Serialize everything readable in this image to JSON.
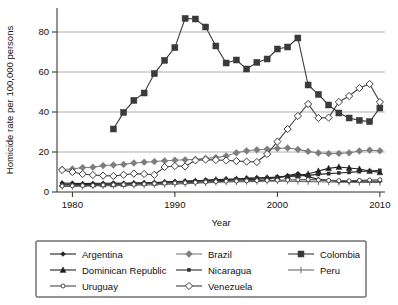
{
  "chart_data": {
    "type": "line",
    "title": "",
    "xlabel": "Year",
    "ylabel": "Homicide rate per 100,000 persons",
    "xlim": [
      1978.5,
      2010.5
    ],
    "ylim": [
      0,
      92
    ],
    "xticks": [
      1980,
      1990,
      2000,
      2010
    ],
    "yticks": [
      0,
      20,
      40,
      60,
      80
    ],
    "xtick_labels": [
      "1980",
      "1990",
      "2000",
      "2010"
    ],
    "ytick_labels": [
      "0",
      "20",
      "40",
      "60",
      "80"
    ],
    "grid": "horizontal",
    "legend_position": "below-plot",
    "series": [
      {
        "name": "Argentina",
        "marker": "filled-diamond-small",
        "color": "#1f1f1f",
        "x": [
          1979,
          1980,
          1981,
          1982,
          1983,
          1984,
          1985,
          1986,
          1987,
          1988,
          1989,
          1990,
          1991,
          1992,
          1993,
          1994,
          1995,
          1996,
          1997,
          1998,
          1999,
          2000,
          2001,
          2002,
          2003,
          2004,
          2005,
          2006,
          2007,
          2008,
          2009,
          2010
        ],
        "y": [
          4.5,
          4.4,
          4.2,
          4.3,
          4.4,
          4.5,
          4.4,
          4.6,
          4.6,
          4.7,
          5.0,
          5.2,
          5.3,
          5.4,
          5.5,
          5.6,
          5.8,
          6.0,
          6.2,
          6.4,
          6.6,
          7.2,
          8.2,
          9.2,
          7.6,
          6.3,
          5.8,
          5.3,
          5.2,
          5.3,
          5.5,
          5.4
        ]
      },
      {
        "name": "Brazil",
        "marker": "filled-diamond",
        "color": "#7d7d7d",
        "x": [
          1979,
          1980,
          1981,
          1982,
          1983,
          1984,
          1985,
          1986,
          1987,
          1988,
          1989,
          1990,
          1991,
          1992,
          1993,
          1994,
          1995,
          1996,
          1997,
          1998,
          1999,
          2000,
          2001,
          2002,
          2003,
          2004,
          2005,
          2006,
          2007,
          2008,
          2009,
          2010
        ],
        "y": [
          11.3,
          11.5,
          12.2,
          12.4,
          13.2,
          13.5,
          13.8,
          14.5,
          14.9,
          15.2,
          15.6,
          15.9,
          16.1,
          16.3,
          16.8,
          17.2,
          18.0,
          19.6,
          20.6,
          21.1,
          21.4,
          21.8,
          22.0,
          21.3,
          20.3,
          19.5,
          19.2,
          19.3,
          19.6,
          20.5,
          20.9,
          20.6
        ]
      },
      {
        "name": "Colombia",
        "marker": "filled-square",
        "color": "#3a3a3a",
        "x": [
          1984,
          1985,
          1986,
          1987,
          1988,
          1989,
          1990,
          1991,
          1992,
          1993,
          1994,
          1995,
          1996,
          1997,
          1998,
          1999,
          2000,
          2001,
          2002,
          2003,
          2004,
          2005,
          2006,
          2007,
          2008,
          2009,
          2010
        ],
        "y": [
          31.5,
          39.8,
          45.8,
          49.5,
          59.2,
          65.8,
          72.2,
          86.8,
          86.5,
          82.5,
          73.0,
          64.5,
          66.0,
          61.5,
          64.8,
          66.5,
          71.5,
          72.5,
          77.0,
          53.5,
          48.8,
          43.5,
          39.5,
          37.0,
          35.8,
          35.2,
          42.0
        ]
      },
      {
        "name": "Dominican Republic",
        "marker": "filled-triangle",
        "color": "#1f1f1f",
        "x": [
          1979,
          1980,
          1981,
          1982,
          1983,
          1984,
          1985,
          1986,
          1987,
          1988,
          1989,
          1990,
          1991,
          1992,
          1993,
          1994,
          1995,
          1996,
          1997,
          1998,
          1999,
          2000,
          2001,
          2002,
          2003,
          2004,
          2005,
          2006,
          2007,
          2008,
          2009,
          2010
        ],
        "y": [
          4.0,
          3.9,
          3.8,
          3.7,
          3.7,
          3.8,
          4.0,
          4.2,
          4.4,
          4.6,
          4.8,
          5.0,
          5.3,
          5.5,
          5.8,
          6.2,
          6.4,
          6.5,
          6.8,
          7.0,
          7.2,
          7.4,
          7.8,
          8.3,
          9.0,
          10.5,
          11.8,
          12.5,
          12.0,
          11.5,
          10.5,
          9.8
        ]
      },
      {
        "name": "Nicaragua",
        "marker": "small-square",
        "color": "#2b2b2b",
        "x": [
          1979,
          1980,
          1981,
          1982,
          1983,
          1984,
          1985,
          1986,
          1987,
          1988,
          1989,
          1990,
          1991,
          1992,
          1993,
          1994,
          1995,
          1996,
          1997,
          1998,
          1999,
          2000,
          2001,
          2002,
          2003,
          2004,
          2005,
          2006,
          2007,
          2008,
          2009,
          2010
        ],
        "y": [
          3.6,
          3.5,
          3.5,
          3.6,
          3.8,
          3.9,
          4.0,
          4.1,
          4.3,
          4.5,
          4.8,
          5.0,
          5.3,
          5.6,
          5.9,
          6.1,
          6.3,
          6.5,
          6.8,
          7.0,
          7.2,
          7.5,
          7.8,
          8.0,
          8.3,
          8.8,
          9.2,
          9.5,
          9.8,
          10.2,
          10.5,
          10.8
        ]
      },
      {
        "name": "Peru",
        "marker": "plus-tick",
        "color": "#6a6a6a",
        "x": [
          1979,
          1980,
          1981,
          1982,
          1983,
          1984,
          1985,
          1986,
          1987,
          1988,
          1989,
          1990,
          1991,
          1992,
          1993,
          1994,
          1995,
          1996,
          1997,
          1998,
          1999,
          2000,
          2001,
          2002,
          2003,
          2004,
          2005,
          2006,
          2007,
          2008,
          2009,
          2010
        ],
        "y": [
          2.8,
          2.8,
          2.9,
          3.0,
          3.1,
          3.2,
          3.3,
          3.4,
          3.5,
          3.6,
          3.8,
          4.0,
          4.2,
          4.4,
          4.6,
          4.8,
          5.0,
          5.1,
          5.2,
          5.3,
          5.4,
          5.5,
          5.4,
          5.3,
          5.2,
          5.1,
          5.0,
          4.9,
          4.9,
          4.8,
          4.8,
          4.8
        ]
      },
      {
        "name": "Uruguay",
        "marker": "small-circle",
        "color": "#4a4a4a",
        "x": [
          1979,
          1980,
          1981,
          1982,
          1983,
          1984,
          1985,
          1986,
          1987,
          1988,
          1989,
          1990,
          1991,
          1992,
          1993,
          1994,
          1995,
          1996,
          1997,
          1998,
          1999,
          2000,
          2001,
          2002,
          2003,
          2004,
          2005,
          2006,
          2007,
          2008,
          2009,
          2010
        ],
        "y": [
          3.0,
          3.1,
          3.2,
          3.3,
          3.5,
          3.6,
          3.7,
          3.8,
          4.0,
          4.2,
          4.4,
          4.5,
          4.6,
          4.8,
          5.0,
          5.2,
          5.4,
          5.5,
          5.6,
          5.7,
          5.8,
          5.9,
          6.0,
          6.1,
          6.2,
          6.0,
          5.8,
          5.7,
          5.6,
          5.8,
          6.0,
          6.1
        ]
      },
      {
        "name": "Venezuela",
        "marker": "open-diamond",
        "color": "#3f3f3f",
        "x": [
          1979,
          1980,
          1981,
          1982,
          1983,
          1984,
          1985,
          1986,
          1987,
          1988,
          1989,
          1990,
          1991,
          1992,
          1993,
          1994,
          1995,
          1996,
          1997,
          1998,
          1999,
          2000,
          2001,
          2002,
          2003,
          2004,
          2005,
          2006,
          2007,
          2008,
          2009,
          2010
        ],
        "y": [
          11.0,
          10.0,
          9.0,
          8.5,
          8.2,
          8.0,
          8.6,
          9.2,
          9.0,
          8.6,
          12.5,
          13.0,
          12.8,
          15.8,
          16.2,
          16.0,
          15.8,
          15.5,
          15.2,
          15.0,
          19.0,
          25.2,
          31.5,
          38.0,
          44.0,
          37.0,
          37.2,
          45.0,
          48.0,
          52.0,
          54.0,
          45.0
        ]
      }
    ]
  },
  "legend": {
    "items": [
      {
        "label": "Argentina",
        "series": "Argentina"
      },
      {
        "label": "Brazil",
        "series": "Brazil"
      },
      {
        "label": "Colombia",
        "series": "Colombia"
      },
      {
        "label": "Dominican Republic",
        "series": "Dominican Republic"
      },
      {
        "label": "Nicaragua",
        "series": "Nicaragua"
      },
      {
        "label": "Peru",
        "series": "Peru"
      },
      {
        "label": "Uruguay",
        "series": "Uruguay"
      },
      {
        "label": "Venezuela",
        "series": "Venezuela"
      }
    ]
  },
  "colors": {
    "background": "#ffffff",
    "axis": "#2b2b2b",
    "grid": "#9a9a9a",
    "text": "#111111"
  }
}
